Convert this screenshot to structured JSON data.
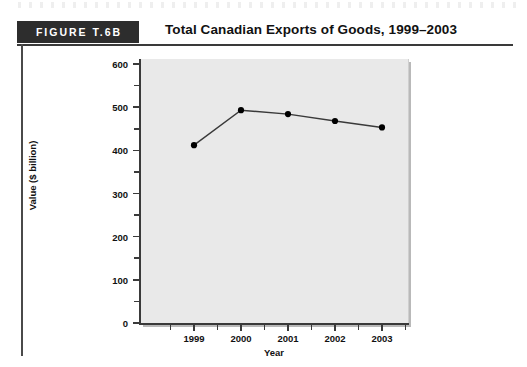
{
  "figure": {
    "tag": "FIGURE T.6B",
    "title": "Total Canadian Exports of Goods, 1999–2003"
  },
  "colors": {
    "tag_background": "#2d2d2d",
    "tag_text": "#ffffff",
    "rule": "#3a3a3a",
    "plot_background": "#e9e9e9",
    "line": "#3a3a3a",
    "marker": "#000000"
  },
  "chart_data": {
    "type": "line",
    "title": "Total Canadian Exports of Goods, 1999–2003",
    "xlabel": "Year",
    "ylabel": "Value ($ billion)",
    "categories": [
      "1999",
      "2000",
      "2001",
      "2002",
      "2003"
    ],
    "values": [
      412,
      493,
      484,
      468,
      453
    ],
    "series": [
      {
        "name": "Total Canadian Exports of Goods",
        "values": [
          412,
          493,
          484,
          468,
          453
        ]
      }
    ],
    "ylim": [
      0,
      600
    ],
    "y_ticks": [
      0,
      100,
      200,
      300,
      400,
      500,
      600
    ],
    "y_tick_labels": [
      "0",
      "100",
      "200",
      "300",
      "400",
      "500",
      "600"
    ],
    "y_minor_ticks": [
      50,
      150,
      250,
      350,
      450,
      550
    ],
    "x_tick_labels": [
      "1999",
      "2000",
      "2001",
      "2002",
      "2003"
    ],
    "grid": false,
    "legend": "none",
    "markers": "filled-circle"
  }
}
